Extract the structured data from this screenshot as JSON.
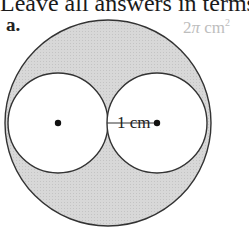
{
  "heading": "Leave all answers in terms",
  "problem": {
    "label": "a.",
    "answer": {
      "coefficient": "2",
      "symbol": "π",
      "unit": "cm",
      "exponent": "2"
    },
    "dimension_label": "1 cm"
  },
  "figure": {
    "outer_circle": {
      "cx": 108,
      "cy": 123,
      "r": 103,
      "fill": "#d9d9d9",
      "stroke": "#333333"
    },
    "inner_circles": [
      {
        "cx": 58,
        "cy": 123,
        "r": 50,
        "fill": "#ffffff",
        "stroke": "#333333"
      },
      {
        "cx": 157,
        "cy": 123,
        "r": 50,
        "fill": "#ffffff",
        "stroke": "#333333"
      }
    ],
    "radius_line": {
      "x1": 107,
      "y1": 123,
      "x2": 157,
      "y2": 123
    }
  }
}
